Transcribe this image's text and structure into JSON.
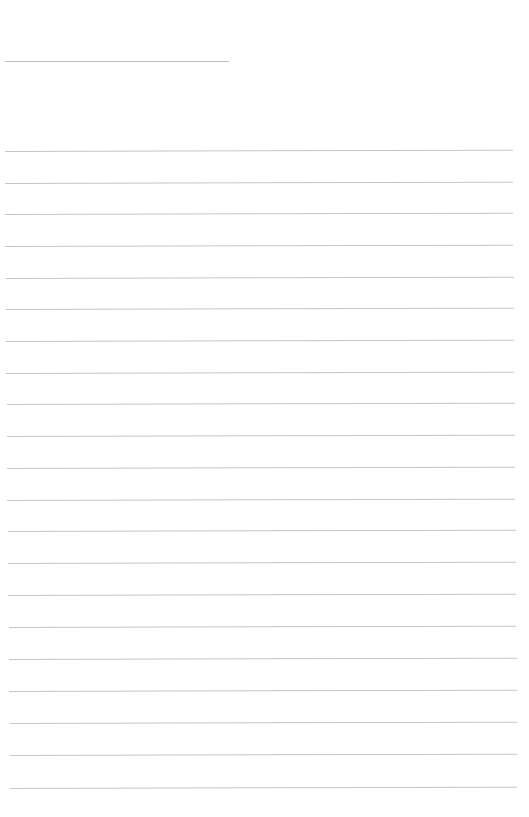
{
  "page": {
    "type": "blank-lined-page",
    "background": "#ffffff",
    "line_color": "#c4c4c4",
    "header_line": {
      "x1": 5,
      "x2": 229,
      "y": 61
    },
    "ruled_lines": [
      {
        "y": 151,
        "x1": 5,
        "x2": 513
      },
      {
        "y": 183,
        "x1": 5,
        "x2": 513
      },
      {
        "y": 214,
        "x1": 5,
        "x2": 513
      },
      {
        "y": 246,
        "x1": 5,
        "x2": 513
      },
      {
        "y": 278,
        "x1": 6,
        "x2": 514
      },
      {
        "y": 309,
        "x1": 6,
        "x2": 514
      },
      {
        "y": 341,
        "x1": 6,
        "x2": 514
      },
      {
        "y": 373,
        "x1": 6,
        "x2": 514
      },
      {
        "y": 404,
        "x1": 7,
        "x2": 515
      },
      {
        "y": 436,
        "x1": 7,
        "x2": 515
      },
      {
        "y": 468,
        "x1": 7,
        "x2": 515
      },
      {
        "y": 500,
        "x1": 7,
        "x2": 515
      },
      {
        "y": 531,
        "x1": 8,
        "x2": 516
      },
      {
        "y": 563,
        "x1": 8,
        "x2": 516
      },
      {
        "y": 595,
        "x1": 8,
        "x2": 516
      },
      {
        "y": 627,
        "x1": 9,
        "x2": 516
      },
      {
        "y": 659,
        "x1": 9,
        "x2": 517
      },
      {
        "y": 691,
        "x1": 9,
        "x2": 517
      },
      {
        "y": 723,
        "x1": 10,
        "x2": 517
      },
      {
        "y": 755,
        "x1": 10,
        "x2": 517
      },
      {
        "y": 788,
        "x1": 10,
        "x2": 517
      }
    ]
  }
}
